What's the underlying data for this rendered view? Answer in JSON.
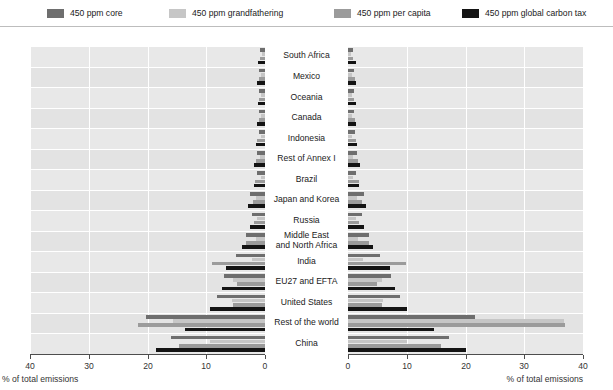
{
  "legend": {
    "items": [
      {
        "label": "450 ppm core",
        "color": "#6e6e6e",
        "key": "core"
      },
      {
        "label": "450 ppm grandfathering",
        "color": "#c6c6c6",
        "key": "grandfathering"
      },
      {
        "label": "450 ppm per capita",
        "color": "#9b9b9b",
        "key": "per_capita"
      },
      {
        "label": "450 ppm global carbon tax",
        "color": "#141414",
        "key": "carbon_tax"
      }
    ]
  },
  "axes": {
    "left": {
      "caption": "% of total emissions",
      "ticks": [
        "40",
        "30",
        "20",
        "10",
        "0"
      ],
      "min": 0,
      "max": 40,
      "direction": "reversed"
    },
    "right": {
      "caption": "% of total emissions",
      "ticks": [
        "0",
        "10",
        "20",
        "30",
        "40"
      ],
      "min": 0,
      "max": 40,
      "direction": "normal"
    }
  },
  "chart_data": {
    "type": "bar",
    "orientation": "horizontal",
    "layout": "back-to-back-panels",
    "title": "",
    "xlabel": "% of total emissions",
    "ylabel": "",
    "xlim": [
      0,
      40
    ],
    "grid": true,
    "legend_position": "top",
    "categories": [
      "South Africa",
      "Mexico",
      "Oceania",
      "Canada",
      "Indonesia",
      "Rest of Annex I",
      "Brazil",
      "Japan and Korea",
      "Russia",
      "Middle East\nand North Africa",
      "India",
      "EU27 and EFTA",
      "United States",
      "Rest of the world",
      "China"
    ],
    "series_order": [
      "core",
      "grandfathering",
      "per_capita",
      "carbon_tax"
    ],
    "panels": [
      {
        "name": "left",
        "series": [
          {
            "name": "450 ppm core",
            "key": "core",
            "color": "#6e6e6e",
            "values": [
              0.8,
              1.0,
              1.0,
              1.0,
              1.1,
              1.4,
              1.3,
              2.6,
              2.2,
              3.2,
              5.0,
              6.9,
              8.2,
              20.2,
              16.0
            ]
          },
          {
            "name": "450 ppm grandfathering",
            "key": "grandfathering",
            "color": "#c6c6c6",
            "values": [
              0.5,
              0.6,
              0.6,
              0.7,
              0.6,
              0.8,
              0.7,
              1.5,
              1.3,
              1.6,
              2.3,
              5.4,
              5.6,
              15.6,
              9.3
            ]
          },
          {
            "name": "450 ppm per capita",
            "key": "per_capita",
            "color": "#9b9b9b",
            "values": [
              0.9,
              1.1,
              1.0,
              1.1,
              1.3,
              1.6,
              1.7,
              2.1,
              1.8,
              3.3,
              9.1,
              4.7,
              5.4,
              21.6,
              14.7
            ]
          },
          {
            "name": "450 ppm global carbon tax",
            "key": "carbon_tax",
            "color": "#141414",
            "values": [
              1.2,
              1.3,
              1.2,
              1.3,
              1.5,
              1.9,
              1.8,
              2.9,
              2.6,
              4.0,
              6.6,
              7.4,
              9.3,
              13.6,
              18.6
            ]
          }
        ]
      },
      {
        "name": "right",
        "series": [
          {
            "name": "450 ppm core",
            "key": "core",
            "color": "#6e6e6e",
            "values": [
              0.9,
              1.1,
              1.1,
              1.1,
              1.2,
              1.5,
              1.4,
              2.8,
              2.4,
              3.5,
              5.4,
              7.4,
              8.8,
              21.7,
              17.2
            ]
          },
          {
            "name": "450 ppm grandfathering",
            "key": "grandfathering",
            "color": "#c6c6c6",
            "values": [
              0.5,
              0.6,
              0.6,
              0.7,
              0.6,
              0.8,
              0.8,
              1.6,
              1.4,
              1.7,
              2.5,
              5.8,
              6.0,
              36.8,
              10.0
            ]
          },
          {
            "name": "450 ppm per capita",
            "key": "per_capita",
            "color": "#9b9b9b",
            "values": [
              0.9,
              1.2,
              1.1,
              1.2,
              1.4,
              1.7,
              1.8,
              2.3,
              1.9,
              3.5,
              9.8,
              5.0,
              5.8,
              37.0,
              15.8
            ]
          },
          {
            "name": "450 ppm global carbon tax",
            "key": "carbon_tax",
            "color": "#141414",
            "values": [
              1.3,
              1.4,
              1.3,
              1.4,
              1.6,
              2.0,
              1.9,
              3.1,
              2.8,
              4.3,
              7.1,
              8.0,
              10.0,
              14.6,
              20.0
            ]
          }
        ]
      }
    ]
  }
}
